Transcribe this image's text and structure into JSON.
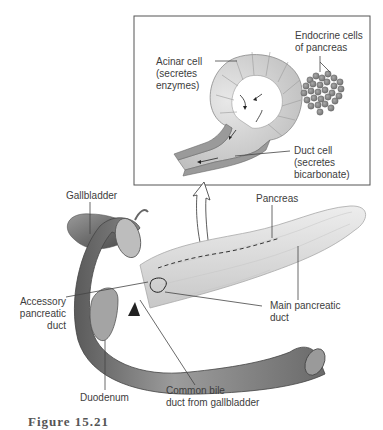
{
  "figure": {
    "caption": "Figure 15.21"
  },
  "inset": {
    "labels": {
      "acinar_cell": [
        "Acinar cell",
        "(secretes",
        "enzymes)"
      ],
      "endocrine_cells": [
        "Endocrine cells",
        "of pancreas"
      ],
      "duct_cell": [
        "Duct cell",
        "(secretes",
        "bicarbonate)"
      ]
    }
  },
  "main": {
    "labels": {
      "gallbladder": "Gallbladder",
      "pancreas": "Pancreas",
      "accessory_duct": [
        "Accessory",
        "pancreatic",
        "duct"
      ],
      "main_duct": [
        "Main pancreatic",
        "duct"
      ],
      "duodenum": "Duodenum",
      "common_bile_duct": [
        "Common bile",
        "duct from gallbladder"
      ]
    }
  },
  "colors": {
    "acinar": "#d4d4d4",
    "duct": "#9a9a9a",
    "endocrine": "#8c8c8c",
    "organ_dark": "#7a7a7a",
    "pancreas": "#e0e0e0",
    "leader": "#444444"
  }
}
